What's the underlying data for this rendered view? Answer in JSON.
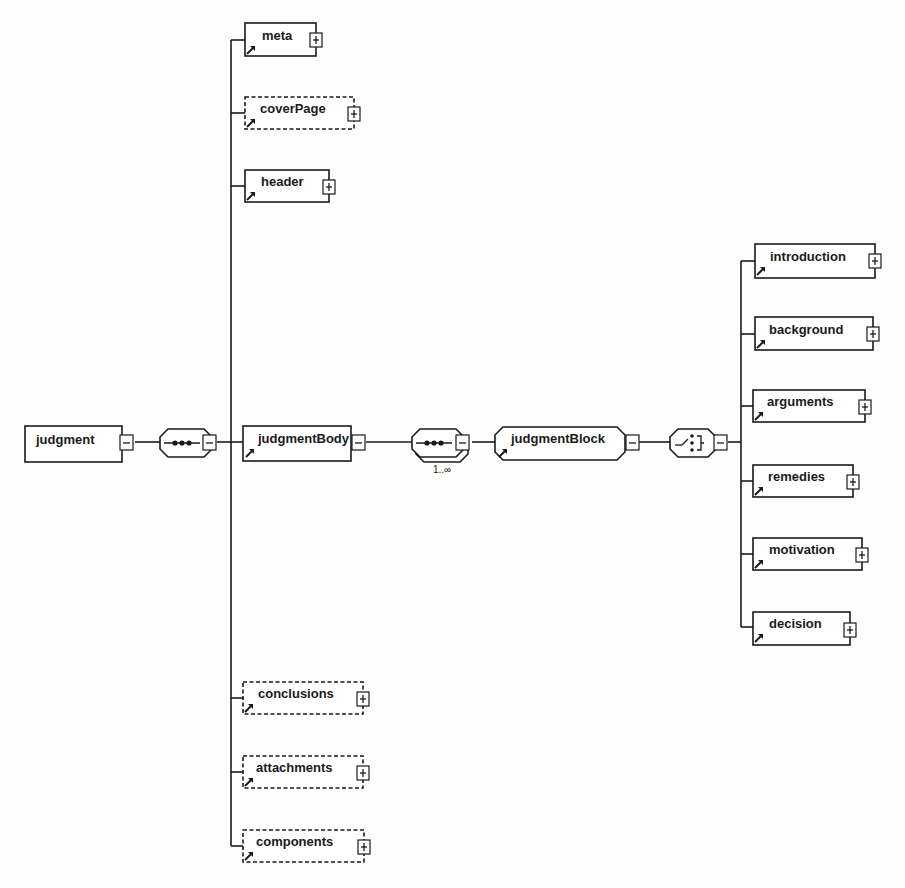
{
  "diagram": {
    "root": {
      "label": "judgment",
      "toggle": "minus"
    },
    "root_compositor": {
      "type": "sequence",
      "toggle": "minus"
    },
    "children": [
      {
        "label": "meta",
        "optional": false,
        "toggle": "plus",
        "is_reference": true
      },
      {
        "label": "coverPage",
        "optional": true,
        "toggle": "plus",
        "is_reference": true
      },
      {
        "label": "header",
        "optional": false,
        "toggle": "plus",
        "is_reference": true
      },
      {
        "label": "judgmentBody",
        "optional": false,
        "toggle": "minus",
        "is_reference": true
      },
      {
        "label": "conclusions",
        "optional": true,
        "toggle": "plus",
        "is_reference": true
      },
      {
        "label": "attachments",
        "optional": true,
        "toggle": "plus",
        "is_reference": true
      },
      {
        "label": "components",
        "optional": true,
        "toggle": "plus",
        "is_reference": true
      }
    ],
    "body_compositor": {
      "type": "sequence",
      "multiplicity": "1..∞",
      "toggle": "minus"
    },
    "group": {
      "label": "judgmentBlock",
      "toggle": "minus",
      "is_reference": true
    },
    "group_compositor": {
      "type": "choice",
      "toggle": "minus"
    },
    "block_children": [
      {
        "label": "introduction",
        "toggle": "plus",
        "is_reference": true
      },
      {
        "label": "background",
        "toggle": "plus",
        "is_reference": true
      },
      {
        "label": "arguments",
        "toggle": "plus",
        "is_reference": true
      },
      {
        "label": "remedies",
        "toggle": "plus",
        "is_reference": true
      },
      {
        "label": "motivation",
        "toggle": "plus",
        "is_reference": true
      },
      {
        "label": "decision",
        "toggle": "plus",
        "is_reference": true
      }
    ],
    "colors": {
      "line": "#1a1a1a",
      "background": "#fdfdfd",
      "box_fill": "#ffffff"
    }
  }
}
